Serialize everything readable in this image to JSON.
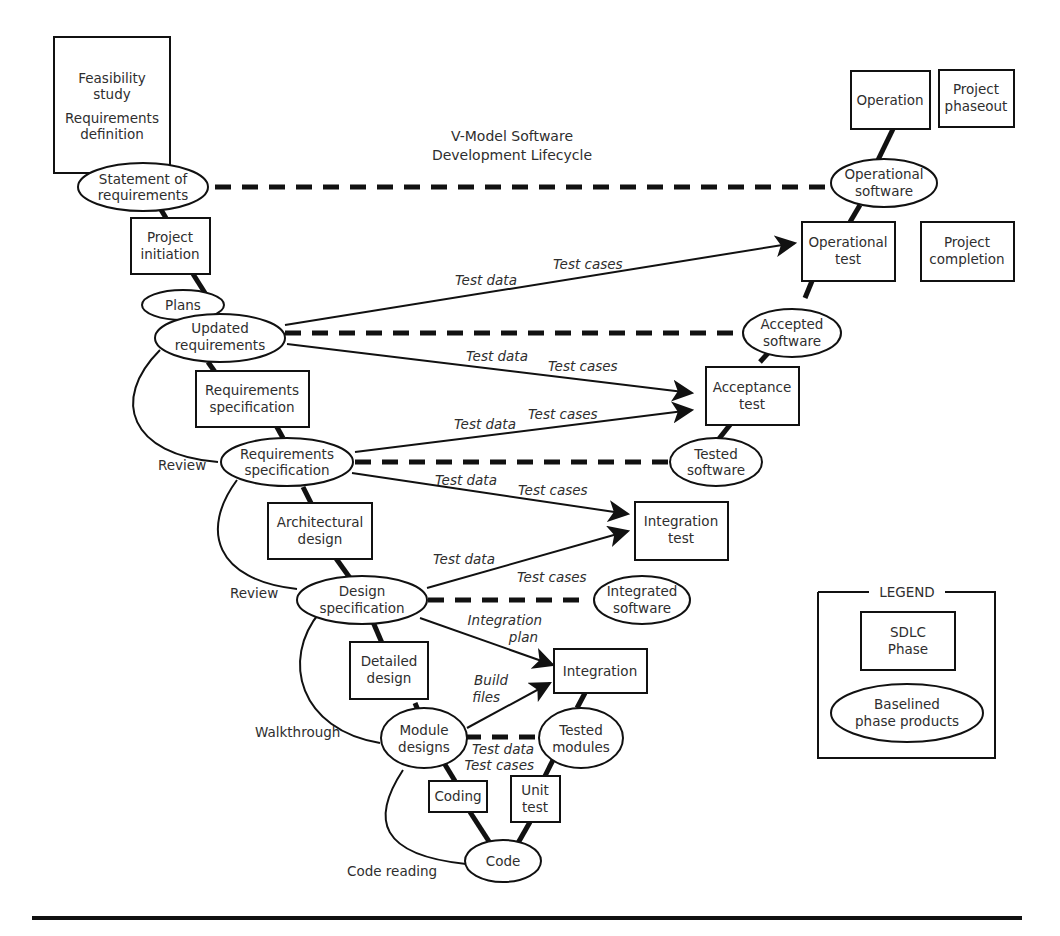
{
  "diagram": {
    "title_line1": "V-Model Software",
    "title_line2": "Development Lifecycle",
    "phases": {
      "feasibility": [
        "Feasibility",
        "study"
      ],
      "req_definition": [
        "Requirements",
        "definition"
      ],
      "project_initiation": [
        "Project",
        "initiation"
      ],
      "requirements_spec_phase": [
        "Requirements",
        "specification"
      ],
      "architectural_design": [
        "Architectural",
        "design"
      ],
      "detailed_design": [
        "Detailed",
        "design"
      ],
      "coding": [
        "Coding"
      ],
      "unit_test": [
        "Unit",
        "test"
      ],
      "integration": [
        "Integration"
      ],
      "integration_test": [
        "Integration",
        "test"
      ],
      "acceptance_test": [
        "Acceptance",
        "test"
      ],
      "operational_test": [
        "Operational",
        "test"
      ],
      "operation": [
        "Operation"
      ],
      "project_phaseout": [
        "Project",
        "phaseout"
      ],
      "project_completion": [
        "Project",
        "completion"
      ]
    },
    "products": {
      "statement_of_requirements": [
        "Statement of",
        "requirements"
      ],
      "plans": [
        "Plans"
      ],
      "updated_requirements": [
        "Updated",
        "requirements"
      ],
      "requirements_specification": [
        "Requirements",
        "specification"
      ],
      "design_specification": [
        "Design",
        "specification"
      ],
      "module_designs": [
        "Module",
        "designs"
      ],
      "code": [
        "Code"
      ],
      "tested_modules": [
        "Tested",
        "modules"
      ],
      "integrated_software": [
        "Integrated",
        "software"
      ],
      "tested_software": [
        "Tested",
        "software"
      ],
      "accepted_software": [
        "Accepted",
        "software"
      ],
      "operational_software": [
        "Operational",
        "software"
      ]
    },
    "reviews": {
      "review1": "Review",
      "review2": "Review",
      "walkthrough": "Walkthrough",
      "code_reading": "Code reading"
    },
    "flow_labels": {
      "test_data": "Test data",
      "test_cases": "Test cases",
      "integration_plan": [
        "Integration",
        "plan"
      ],
      "build_files": [
        "Build",
        "files"
      ]
    },
    "legend": {
      "title": "LEGEND",
      "phase": [
        "SDLC",
        "Phase"
      ],
      "product": [
        "Baselined",
        "phase products"
      ]
    }
  }
}
